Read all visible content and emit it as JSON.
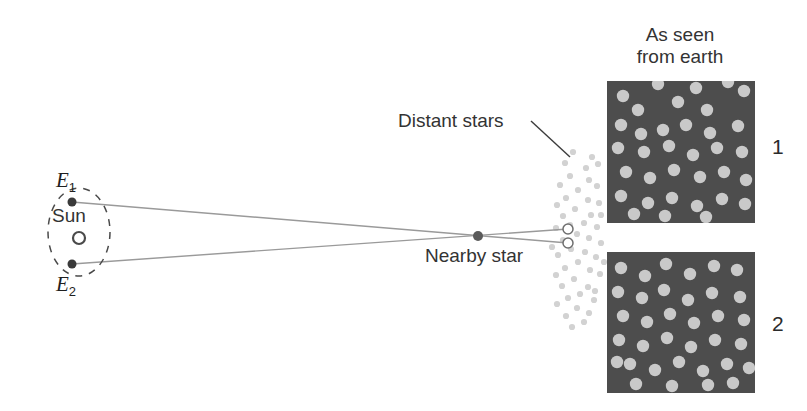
{
  "figure": {
    "background_color": "#ffffff"
  },
  "labels": {
    "as_seen_from_earth": "As seen\nfrom earth",
    "distant_stars": "Distant stars",
    "nearby_star": "Nearby star",
    "sun": "Sun",
    "earth_position_1": "E",
    "earth_position_1_sub": "1",
    "earth_position_2": "E",
    "earth_position_2_sub": "2",
    "panel_1_number": "1",
    "panel_2_number": "2"
  },
  "colors": {
    "line": "#9a9a9a",
    "leader_line": "#3c3c3c",
    "orbit_dash": "#4a4a4a",
    "earth_dot": "#3a3a3a",
    "nearby_star_dot": "#5a5a5a",
    "sun_circle_stroke": "#4a4a4a",
    "sun_circle_fill": "#ffffff",
    "open_circle_stroke": "#6f6f6f",
    "open_circle_fill": "#ffffff",
    "distant_star_dot": "#d2d2d2",
    "panel_background": "#4d4d4d",
    "panel_star": "#c9c9c9",
    "text": "#2b2b2b"
  },
  "geometry": {
    "orbit_ellipse": {
      "cx": 79,
      "cy": 232,
      "rx": 31,
      "ry": 44
    },
    "sun": {
      "cx": 79,
      "cy": 238,
      "r": 6
    },
    "earth_1": {
      "cx": 72,
      "cy": 202,
      "r": 4.5
    },
    "earth_2": {
      "cx": 72,
      "cy": 264,
      "r": 4.5
    },
    "nearby_star": {
      "cx": 478,
      "cy": 236,
      "r": 5
    },
    "sight_line_1": {
      "x1": 72,
      "y1": 202,
      "x2": 568,
      "y2": 243
    },
    "sight_line_2": {
      "x1": 72,
      "y1": 264,
      "x2": 568,
      "y2": 229
    },
    "open_circle_top": {
      "cx": 568,
      "cy": 229,
      "r": 5
    },
    "open_circle_bottom": {
      "cx": 568,
      "cy": 243,
      "r": 5
    },
    "leader_line": {
      "x1": 531,
      "y1": 121,
      "x2": 570,
      "y2": 157
    }
  },
  "distant_star_field": {
    "description": "Vertical band of faint dots representing the distant star background",
    "dot_radius": 3.1,
    "dots": [
      [
        573,
        152
      ],
      [
        592,
        157
      ],
      [
        565,
        163
      ],
      [
        586,
        168
      ],
      [
        598,
        164
      ],
      [
        570,
        176
      ],
      [
        589,
        180
      ],
      [
        560,
        185
      ],
      [
        597,
        186
      ],
      [
        578,
        190
      ],
      [
        566,
        198
      ],
      [
        588,
        200
      ],
      [
        557,
        205
      ],
      [
        599,
        203
      ],
      [
        575,
        209
      ],
      [
        563,
        216
      ],
      [
        591,
        215
      ],
      [
        584,
        223
      ],
      [
        570,
        225
      ],
      [
        556,
        228
      ],
      [
        597,
        227
      ],
      [
        577,
        234
      ],
      [
        563,
        240
      ],
      [
        589,
        238
      ],
      [
        601,
        243
      ],
      [
        571,
        249
      ],
      [
        585,
        252
      ],
      [
        558,
        255
      ],
      [
        596,
        257
      ],
      [
        578,
        262
      ],
      [
        565,
        268
      ],
      [
        590,
        270
      ],
      [
        556,
        275
      ],
      [
        600,
        274
      ],
      [
        574,
        279
      ],
      [
        562,
        286
      ],
      [
        588,
        287
      ],
      [
        580,
        294
      ],
      [
        568,
        298
      ],
      [
        594,
        300
      ],
      [
        557,
        304
      ],
      [
        577,
        308
      ],
      [
        589,
        313
      ],
      [
        566,
        316
      ],
      [
        584,
        322
      ],
      [
        572,
        327
      ],
      [
        595,
        291
      ],
      [
        601,
        215
      ],
      [
        552,
        247
      ],
      [
        604,
        262
      ]
    ]
  },
  "panels": [
    {
      "name": "panel-1",
      "number": "1",
      "x": 607,
      "y": 81,
      "width": 148,
      "height": 142,
      "star_radius": 6.2,
      "stars": [
        [
          623,
          96
        ],
        [
          638,
          110
        ],
        [
          658,
          84
        ],
        [
          678,
          102
        ],
        [
          696,
          88
        ],
        [
          707,
          110
        ],
        [
          728,
          82
        ],
        [
          744,
          91
        ],
        [
          621,
          125
        ],
        [
          641,
          134
        ],
        [
          663,
          130
        ],
        [
          686,
          125
        ],
        [
          710,
          133
        ],
        [
          738,
          126
        ],
        [
          618,
          148
        ],
        [
          644,
          152
        ],
        [
          669,
          146
        ],
        [
          693,
          155
        ],
        [
          717,
          148
        ],
        [
          742,
          152
        ],
        [
          626,
          172
        ],
        [
          650,
          178
        ],
        [
          674,
          170
        ],
        [
          700,
          177
        ],
        [
          724,
          172
        ],
        [
          746,
          180
        ],
        [
          621,
          196
        ],
        [
          648,
          203
        ],
        [
          672,
          198
        ],
        [
          697,
          206
        ],
        [
          722,
          199
        ],
        [
          745,
          204
        ],
        [
          634,
          214
        ],
        [
          665,
          216
        ],
        [
          706,
          217
        ]
      ]
    },
    {
      "name": "panel-2",
      "number": "2",
      "x": 607,
      "y": 252,
      "width": 148,
      "height": 141,
      "star_radius": 6.2,
      "stars": [
        [
          621,
          268
        ],
        [
          645,
          276
        ],
        [
          666,
          264
        ],
        [
          690,
          274
        ],
        [
          714,
          266
        ],
        [
          737,
          270
        ],
        [
          618,
          292
        ],
        [
          642,
          298
        ],
        [
          664,
          290
        ],
        [
          688,
          300
        ],
        [
          712,
          293
        ],
        [
          740,
          297
        ],
        [
          623,
          316
        ],
        [
          647,
          322
        ],
        [
          670,
          314
        ],
        [
          694,
          323
        ],
        [
          718,
          316
        ],
        [
          744,
          320
        ],
        [
          619,
          340
        ],
        [
          643,
          346
        ],
        [
          667,
          338
        ],
        [
          691,
          347
        ],
        [
          715,
          340
        ],
        [
          741,
          344
        ],
        [
          630,
          364
        ],
        [
          655,
          370
        ],
        [
          679,
          362
        ],
        [
          703,
          371
        ],
        [
          727,
          364
        ],
        [
          749,
          368
        ],
        [
          636,
          384
        ],
        [
          672,
          386
        ],
        [
          708,
          385
        ],
        [
          733,
          383
        ],
        [
          617,
          362
        ]
      ]
    }
  ]
}
